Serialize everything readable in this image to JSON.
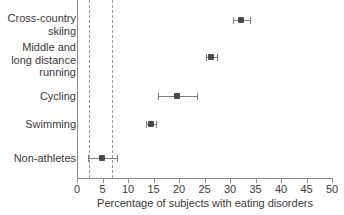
{
  "chart_data": {
    "type": "scatter",
    "title": "",
    "subtitle": "",
    "xlabel": "Percentage of subjects with eating disorders",
    "ylabel": "",
    "xlim": [
      0,
      50
    ],
    "xticks": [
      0,
      5,
      10,
      15,
      20,
      25,
      30,
      35,
      40,
      45,
      50
    ],
    "xtick_labels": [
      "0",
      "5",
      "10",
      "15",
      "20",
      "25",
      "30",
      "35",
      "40",
      "45",
      "50"
    ],
    "grid": false,
    "legend": null,
    "orientation": "horizontal",
    "error_bars": "horizontal 95% confidence intervals",
    "reference_lines": [
      {
        "name": "lower-reference-line",
        "value": 2.4,
        "style": "dashed"
      },
      {
        "name": "upper-reference-line",
        "value": 6.9,
        "style": "dashed"
      }
    ],
    "categories": [
      "Cross-country\nskiing",
      "Middle and\nlong distance\nrunning",
      "Cycling",
      "Swimming",
      "Non-athletes"
    ],
    "values": [
      32.1,
      26.3,
      19.6,
      14.5,
      4.9
    ],
    "ci_low": [
      30.5,
      25.3,
      15.8,
      13.6,
      2.2
    ],
    "ci_high": [
      33.9,
      27.4,
      23.5,
      15.5,
      7.8
    ],
    "points": [
      {
        "label": "Cross-country skiing",
        "label_lines": [
          "Cross-country",
          "skiing"
        ],
        "value": 32.1,
        "ci_low": 30.5,
        "ci_high": 33.9,
        "row_y": 20,
        "label_y": 12
      },
      {
        "label": "Middle and long distance running",
        "label_lines": [
          "Middle and",
          "long distance",
          "running"
        ],
        "value": 26.3,
        "ci_low": 25.3,
        "ci_high": 27.4,
        "row_y": 57,
        "label_y": 41
      },
      {
        "label": "Cycling",
        "label_lines": [
          "Cycling"
        ],
        "value": 19.6,
        "ci_low": 15.8,
        "ci_high": 23.5,
        "row_y": 96,
        "label_y": 90
      },
      {
        "label": "Swimming",
        "label_lines": [
          "Swimming"
        ],
        "value": 14.5,
        "ci_low": 13.6,
        "ci_high": 15.5,
        "row_y": 124,
        "label_y": 118
      },
      {
        "label": "Non-athletes",
        "label_lines": [
          "Non-athletes"
        ],
        "value": 4.9,
        "ci_low": 2.2,
        "ci_high": 7.8,
        "row_y": 158,
        "label_y": 152
      }
    ]
  },
  "colors": {
    "background": "#ffffff",
    "axis": "#8c8c8c",
    "text": "#3a3a3a",
    "marker": "#4a4a4a",
    "error_bar": "#7d7d7d",
    "reference_line": "#9a9a9a"
  }
}
